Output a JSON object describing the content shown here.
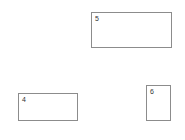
{
  "boxes": [
    {
      "label": "5"
    },
    {
      "label": "4"
    },
    {
      "label": "6"
    }
  ],
  "colors": {
    "border": "#8c8c8c",
    "text": "#333333",
    "background": "#ffffff"
  }
}
